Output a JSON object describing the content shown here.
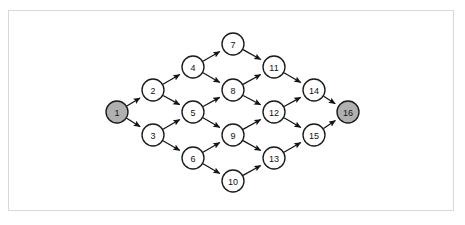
{
  "figure": {
    "type": "directed-acyclic-graph",
    "background_color": "#ffffff",
    "frame_color": "#d8d8d8",
    "node_fill": "#ffffff",
    "node_highlight_fill": "#b0b0b0",
    "node_stroke": "#1a1a1a",
    "edge_color": "#141414",
    "node_radius": 11
  },
  "chart_data": {
    "type": "diagram",
    "title": "",
    "nodes": [
      {
        "id": 1,
        "label": "1",
        "x": 117,
        "y": 112,
        "highlight": true,
        "column": 0
      },
      {
        "id": 2,
        "label": "2",
        "x": 153,
        "y": 90,
        "highlight": false,
        "column": 1
      },
      {
        "id": 3,
        "label": "3",
        "x": 153,
        "y": 135,
        "highlight": false,
        "column": 1
      },
      {
        "id": 4,
        "label": "4",
        "x": 193,
        "y": 67,
        "highlight": false,
        "column": 2
      },
      {
        "id": 5,
        "label": "5",
        "x": 193,
        "y": 112,
        "highlight": false,
        "column": 2
      },
      {
        "id": 6,
        "label": "6",
        "x": 193,
        "y": 158,
        "highlight": false,
        "column": 2
      },
      {
        "id": 7,
        "label": "7",
        "x": 233,
        "y": 44,
        "highlight": false,
        "column": 3
      },
      {
        "id": 8,
        "label": "8",
        "x": 233,
        "y": 90,
        "highlight": false,
        "column": 3
      },
      {
        "id": 9,
        "label": "9",
        "x": 233,
        "y": 135,
        "highlight": false,
        "column": 3
      },
      {
        "id": 10,
        "label": "10",
        "x": 233,
        "y": 181,
        "highlight": false,
        "column": 3
      },
      {
        "id": 11,
        "label": "11",
        "x": 274,
        "y": 67,
        "highlight": false,
        "column": 4
      },
      {
        "id": 12,
        "label": "12",
        "x": 274,
        "y": 112,
        "highlight": false,
        "column": 4
      },
      {
        "id": 13,
        "label": "13",
        "x": 274,
        "y": 158,
        "highlight": false,
        "column": 4
      },
      {
        "id": 14,
        "label": "14",
        "x": 314,
        "y": 90,
        "highlight": false,
        "column": 5
      },
      {
        "id": 15,
        "label": "15",
        "x": 314,
        "y": 135,
        "highlight": false,
        "column": 5
      },
      {
        "id": 16,
        "label": "16",
        "x": 348,
        "y": 112,
        "highlight": true,
        "column": 6
      }
    ],
    "edges": [
      {
        "from": 1,
        "to": 2
      },
      {
        "from": 1,
        "to": 3
      },
      {
        "from": 2,
        "to": 4
      },
      {
        "from": 2,
        "to": 5
      },
      {
        "from": 3,
        "to": 5
      },
      {
        "from": 3,
        "to": 6
      },
      {
        "from": 4,
        "to": 7
      },
      {
        "from": 4,
        "to": 8
      },
      {
        "from": 5,
        "to": 8
      },
      {
        "from": 5,
        "to": 9
      },
      {
        "from": 6,
        "to": 9
      },
      {
        "from": 6,
        "to": 10
      },
      {
        "from": 7,
        "to": 11
      },
      {
        "from": 8,
        "to": 11
      },
      {
        "from": 8,
        "to": 12
      },
      {
        "from": 9,
        "to": 12
      },
      {
        "from": 9,
        "to": 13
      },
      {
        "from": 10,
        "to": 13
      },
      {
        "from": 11,
        "to": 14
      },
      {
        "from": 12,
        "to": 14
      },
      {
        "from": 12,
        "to": 15
      },
      {
        "from": 13,
        "to": 15
      },
      {
        "from": 14,
        "to": 16
      },
      {
        "from": 15,
        "to": 16
      }
    ],
    "source_node": 1,
    "sink_node": 16,
    "directed": true
  }
}
